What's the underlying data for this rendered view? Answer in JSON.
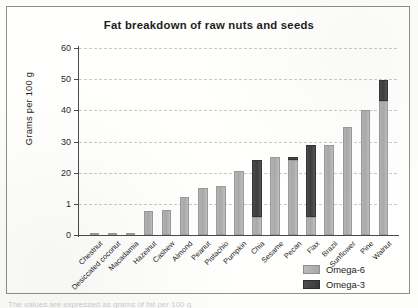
{
  "figure": {
    "title": "Fat breakdown of raw nuts and seeds",
    "caption_sliver": "The values are expressed as grams of fat per 100 g"
  },
  "legend": {
    "position": "bottom-right",
    "items": [
      {
        "label": "Omega-6",
        "color": "#b0b0b0",
        "name": "omega-6"
      },
      {
        "label": "Omega-3",
        "color": "#414141",
        "name": "omega-3"
      }
    ]
  },
  "chart_data": {
    "type": "bar",
    "stacked": true,
    "title": "Fat breakdown of raw nuts and seeds",
    "xlabel": "",
    "ylabel": "Grams per 100 g",
    "ylim": [
      0,
      60
    ],
    "yticks": [
      0,
      1,
      20,
      30,
      40,
      50,
      60
    ],
    "ytick_labels": [
      "0",
      "1",
      "20",
      "30",
      "40",
      "50",
      "60"
    ],
    "grid": true,
    "grid_axis": "y",
    "categories": [
      "Chestnut",
      "Desiccated coconut",
      "Macadamia",
      "Hazelnut",
      "Cashew",
      "Almond",
      "Peanut",
      "Pistachio",
      "Pumpkin",
      "Chia",
      "Sesame",
      "Pecan",
      "Flax",
      "Brazil",
      "Sunflower",
      "Pine",
      "Walnut"
    ],
    "series": [
      {
        "name": "Omega-6",
        "color": "#b0b0b0",
        "values": [
          0.2,
          0.4,
          0.5,
          7.8,
          8.0,
          12.3,
          15.0,
          15.8,
          20.7,
          5.8,
          25.0,
          24.0,
          5.8,
          29.0,
          34.5,
          40.0,
          43.0
        ]
      },
      {
        "name": "Omega-3",
        "color": "#414141",
        "values": [
          0,
          0,
          0,
          0,
          0,
          0,
          0,
          0,
          0,
          18.2,
          0,
          1.0,
          23.2,
          0,
          0,
          0,
          6.8
        ]
      }
    ],
    "totals": [
      0.2,
      0.4,
      0.5,
      7.8,
      8.0,
      12.3,
      15.0,
      15.8,
      20.7,
      24.0,
      25.0,
      25.0,
      29.0,
      29.0,
      34.5,
      40.0,
      49.8
    ]
  }
}
